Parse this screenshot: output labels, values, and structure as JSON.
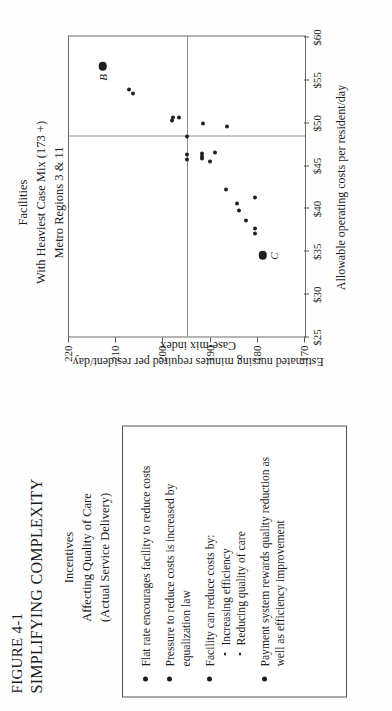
{
  "figure": {
    "number": "FIGURE 4-1",
    "title": "SIMPLIFYING COMPLEXITY"
  },
  "panel": {
    "heading_line1": "Incentives",
    "heading_line2": "Affecting Quality of Care",
    "heading_line3": "(Actual Service Delivery)",
    "bullets": [
      {
        "text": "Flat rate encourages facility to reduce costs",
        "sub": []
      },
      {
        "text": "Pressure to reduce costs is increased by equalization law",
        "sub": []
      },
      {
        "text": "Facility can reduce costs by:",
        "sub": [
          "Increasing efficiency",
          "Reducing quality of care"
        ]
      },
      {
        "text": "Payment system rewards quality reduction as well as efficiency improvement",
        "sub": []
      }
    ]
  },
  "chart_data": {
    "type": "scatter",
    "title": "Facilities",
    "subtitle_line1": "With Heaviest Case Mix (173 +)",
    "subtitle_line2": "Metro Regions 3 & 11",
    "xlabel": "Allowable operating costs per resident/day",
    "ylabel": "Estimated nursing minutes required per resident/day",
    "ylabel_sub": "Case-mix index",
    "xlim": [
      25,
      60
    ],
    "ylim": [
      170,
      220
    ],
    "xticks": [
      25,
      30,
      35,
      40,
      45,
      50,
      55,
      60
    ],
    "xticklabels": [
      "$25",
      "$30",
      "$35",
      "$40",
      "$45",
      "$50",
      "$55",
      "$60"
    ],
    "yticks": [
      220,
      210,
      200,
      190,
      180,
      170
    ],
    "yticklabels": [
      "220",
      "210",
      "200",
      "190",
      "180",
      "170"
    ],
    "grid": false,
    "legend": "none",
    "reference_lines": [
      {
        "orient": "horizontal",
        "value": 195.0
      },
      {
        "orient": "vertical",
        "value": 48.3
      }
    ],
    "points": [
      {
        "x": 56.5,
        "y": 212.8,
        "size": "big",
        "label": "B"
      },
      {
        "x": 53.3,
        "y": 206.5,
        "size": "s",
        "label": ""
      },
      {
        "x": 53.8,
        "y": 207.2,
        "size": "s",
        "label": ""
      },
      {
        "x": 50.5,
        "y": 198.0,
        "size": "s",
        "label": ""
      },
      {
        "x": 50.5,
        "y": 196.8,
        "size": "s",
        "label": ""
      },
      {
        "x": 50.2,
        "y": 198.2,
        "size": "s",
        "label": ""
      },
      {
        "x": 48.3,
        "y": 195.0,
        "size": "s",
        "label": ""
      },
      {
        "x": 45.6,
        "y": 195.0,
        "size": "s",
        "label": ""
      },
      {
        "x": 46.2,
        "y": 195.0,
        "size": "s",
        "label": ""
      },
      {
        "x": 45.8,
        "y": 191.8,
        "size": "s",
        "label": ""
      },
      {
        "x": 46.3,
        "y": 191.8,
        "size": "s",
        "label": ""
      },
      {
        "x": 46.0,
        "y": 191.9,
        "size": "s",
        "label": ""
      },
      {
        "x": 49.8,
        "y": 191.6,
        "size": "s",
        "label": ""
      },
      {
        "x": 45.4,
        "y": 190.2,
        "size": "s",
        "label": ""
      },
      {
        "x": 46.5,
        "y": 189.0,
        "size": "s",
        "label": ""
      },
      {
        "x": 42.2,
        "y": 186.8,
        "size": "s",
        "label": ""
      },
      {
        "x": 49.5,
        "y": 186.5,
        "size": "s",
        "label": ""
      },
      {
        "x": 39.7,
        "y": 184.0,
        "size": "s",
        "label": ""
      },
      {
        "x": 40.5,
        "y": 184.4,
        "size": "s",
        "label": ""
      },
      {
        "x": 38.5,
        "y": 182.6,
        "size": "s",
        "label": ""
      },
      {
        "x": 37.0,
        "y": 180.6,
        "size": "s",
        "label": ""
      },
      {
        "x": 37.6,
        "y": 180.6,
        "size": "s",
        "label": ""
      },
      {
        "x": 41.2,
        "y": 180.5,
        "size": "s",
        "label": ""
      },
      {
        "x": 34.5,
        "y": 179.0,
        "size": "big",
        "label": "C"
      }
    ]
  }
}
